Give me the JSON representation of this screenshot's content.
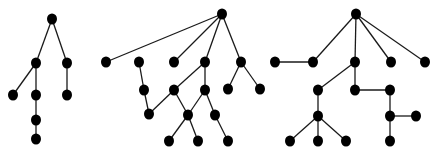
{
  "canvas": {
    "width": 439,
    "height": 152,
    "background": "#ffffff"
  },
  "style": {
    "node_color": "#000000",
    "edge_color": "#1a1a1a",
    "node_rx": 5,
    "node_ry": 5.5
  },
  "diagram": {
    "type": "tree-graphs",
    "components": [
      {
        "name": "tree-1",
        "nodes": [
          {
            "id": "a0",
            "x": 52,
            "y": 19
          },
          {
            "id": "a1",
            "x": 36,
            "y": 63
          },
          {
            "id": "a2",
            "x": 67,
            "y": 63
          },
          {
            "id": "a3",
            "x": 13,
            "y": 95
          },
          {
            "id": "a4",
            "x": 36,
            "y": 95
          },
          {
            "id": "a5",
            "x": 67,
            "y": 95
          },
          {
            "id": "a6",
            "x": 36,
            "y": 120
          },
          {
            "id": "a7",
            "x": 36,
            "y": 139
          }
        ],
        "edges": [
          [
            "a0",
            "a1"
          ],
          [
            "a0",
            "a2"
          ],
          [
            "a1",
            "a3"
          ],
          [
            "a1",
            "a4"
          ],
          [
            "a2",
            "a5"
          ],
          [
            "a4",
            "a6"
          ],
          [
            "a6",
            "a7"
          ]
        ]
      },
      {
        "name": "tree-2",
        "nodes": [
          {
            "id": "b0",
            "x": 222,
            "y": 14
          },
          {
            "id": "b1",
            "x": 106,
            "y": 62
          },
          {
            "id": "b2",
            "x": 139,
            "y": 62
          },
          {
            "id": "b3",
            "x": 174,
            "y": 62
          },
          {
            "id": "b4",
            "x": 205,
            "y": 62
          },
          {
            "id": "b5",
            "x": 241,
            "y": 62
          },
          {
            "id": "b6",
            "x": 144,
            "y": 90
          },
          {
            "id": "b7",
            "x": 174,
            "y": 90
          },
          {
            "id": "b8",
            "x": 205,
            "y": 90
          },
          {
            "id": "b9",
            "x": 228,
            "y": 89
          },
          {
            "id": "b10",
            "x": 260,
            "y": 89
          },
          {
            "id": "b11",
            "x": 149,
            "y": 114
          },
          {
            "id": "b12",
            "x": 188,
            "y": 115
          },
          {
            "id": "b13",
            "x": 215,
            "y": 115
          },
          {
            "id": "b14",
            "x": 169,
            "y": 141
          },
          {
            "id": "b15",
            "x": 198,
            "y": 141
          },
          {
            "id": "b16",
            "x": 228,
            "y": 141
          }
        ],
        "edges": [
          [
            "b0",
            "b1"
          ],
          [
            "b0",
            "b3"
          ],
          [
            "b0",
            "b4"
          ],
          [
            "b0",
            "b5"
          ],
          [
            "b2",
            "b6"
          ],
          [
            "b6",
            "b11"
          ],
          [
            "b11",
            "b7"
          ],
          [
            "b4",
            "b7"
          ],
          [
            "b4",
            "b8"
          ],
          [
            "b5",
            "b9"
          ],
          [
            "b5",
            "b10"
          ],
          [
            "b7",
            "b12"
          ],
          [
            "b8",
            "b12"
          ],
          [
            "b8",
            "b13"
          ],
          [
            "b12",
            "b14"
          ],
          [
            "b12",
            "b15"
          ],
          [
            "b13",
            "b16"
          ]
        ]
      },
      {
        "name": "tree-3",
        "nodes": [
          {
            "id": "c0",
            "x": 356,
            "y": 14
          },
          {
            "id": "c1",
            "x": 275,
            "y": 62
          },
          {
            "id": "c2",
            "x": 313,
            "y": 62
          },
          {
            "id": "c3",
            "x": 355,
            "y": 62
          },
          {
            "id": "c4",
            "x": 391,
            "y": 62
          },
          {
            "id": "c5",
            "x": 425,
            "y": 62
          },
          {
            "id": "c6",
            "x": 318,
            "y": 90
          },
          {
            "id": "c7",
            "x": 355,
            "y": 90
          },
          {
            "id": "c8",
            "x": 390,
            "y": 90
          },
          {
            "id": "c9",
            "x": 318,
            "y": 116
          },
          {
            "id": "c10",
            "x": 390,
            "y": 116
          },
          {
            "id": "c11",
            "x": 416,
            "y": 116
          },
          {
            "id": "c12",
            "x": 290,
            "y": 141
          },
          {
            "id": "c13",
            "x": 318,
            "y": 141
          },
          {
            "id": "c14",
            "x": 346,
            "y": 141
          },
          {
            "id": "c15",
            "x": 390,
            "y": 141
          }
        ],
        "edges": [
          [
            "c0",
            "c2"
          ],
          [
            "c0",
            "c3"
          ],
          [
            "c0",
            "c4"
          ],
          [
            "c0",
            "c5"
          ],
          [
            "c1",
            "c2"
          ],
          [
            "c3",
            "c6"
          ],
          [
            "c3",
            "c7"
          ],
          [
            "c7",
            "c8"
          ],
          [
            "c8",
            "c10"
          ],
          [
            "c10",
            "c11"
          ],
          [
            "c10",
            "c15"
          ],
          [
            "c6",
            "c9"
          ],
          [
            "c9",
            "c12"
          ],
          [
            "c9",
            "c13"
          ],
          [
            "c9",
            "c14"
          ]
        ]
      }
    ]
  }
}
